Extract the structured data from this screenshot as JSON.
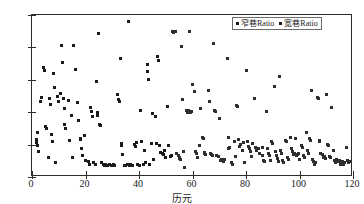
{
  "chart_data": {
    "type": "scatter",
    "title": "",
    "xlabel": "历元",
    "ylabel": "Ratio",
    "xlim": [
      0,
      120
    ],
    "ylim": [
      0,
      150
    ],
    "grid": false,
    "legend_position": "top-right",
    "xticks": [
      0,
      20,
      40,
      60,
      80,
      100,
      120
    ],
    "yticks": [
      0,
      30,
      60,
      90,
      120,
      150
    ],
    "xtick_labels": [
      "0",
      "20",
      "40",
      "60",
      "80",
      "100",
      "120"
    ],
    "ytick_labels": [
      "0",
      "30",
      "60",
      "90",
      "120",
      "150"
    ],
    "series": [
      {
        "name": "窄巷Ratio",
        "marker": "square",
        "color": "#1a1a1a",
        "points": [
          [
            1.5,
            32
          ],
          [
            1.8,
            35
          ],
          [
            2.0,
            29
          ],
          [
            2.2,
            41
          ],
          [
            2.6,
            24
          ],
          [
            3.3,
            70
          ],
          [
            3.6,
            74
          ],
          [
            4.3,
            101
          ],
          [
            4.6,
            99
          ],
          [
            5.0,
            47
          ],
          [
            5.3,
            45
          ],
          [
            6.0,
            18
          ],
          [
            6.6,
            73
          ],
          [
            7.0,
            67
          ],
          [
            7.3,
            39
          ],
          [
            7.6,
            33
          ],
          [
            8.0,
            96
          ],
          [
            8.3,
            83
          ],
          [
            8.6,
            13
          ],
          [
            9.6,
            75
          ],
          [
            10.0,
            70
          ],
          [
            10.6,
            77
          ],
          [
            11.0,
            122
          ],
          [
            11.3,
            106
          ],
          [
            11.6,
            73
          ],
          [
            12.0,
            63
          ],
          [
            12.3,
            49
          ],
          [
            12.6,
            45
          ],
          [
            13.6,
            71
          ],
          [
            14.0,
            34
          ],
          [
            14.6,
            57
          ],
          [
            15.0,
            18
          ],
          [
            15.6,
            122
          ],
          [
            16.3,
            100
          ],
          [
            17.0,
            69
          ],
          [
            17.3,
            52
          ],
          [
            18.0,
            36
          ],
          [
            18.3,
            35
          ],
          [
            18.6,
            26
          ],
          [
            19.0,
            20
          ],
          [
            19.6,
            38
          ],
          [
            20.0,
            15
          ],
          [
            21.0,
            14
          ],
          [
            21.6,
            12
          ],
          [
            22.0,
            64
          ],
          [
            22.3,
            61
          ],
          [
            22.6,
            56
          ],
          [
            23.0,
            13
          ],
          [
            23.6,
            12
          ],
          [
            24.0,
            88
          ],
          [
            24.3,
            60
          ],
          [
            24.6,
            57
          ],
          [
            25.0,
            133
          ],
          [
            25.3,
            49
          ],
          [
            25.6,
            48
          ],
          [
            26.0,
            13
          ],
          [
            26.6,
            12
          ],
          [
            27.0,
            11
          ],
          [
            27.6,
            12
          ],
          [
            28.3,
            11
          ],
          [
            29.0,
            12
          ],
          [
            29.6,
            11
          ],
          [
            30.6,
            12
          ],
          [
            31.0,
            11
          ],
          [
            32.0,
            76
          ],
          [
            32.3,
            72
          ],
          [
            32.6,
            70
          ],
          [
            33.0,
            110
          ],
          [
            33.3,
            31
          ],
          [
            33.6,
            29
          ],
          [
            34.0,
            21
          ],
          [
            34.6,
            11
          ],
          [
            35.0,
            11
          ],
          [
            35.6,
            12
          ],
          [
            36.0,
            144
          ],
          [
            36.6,
            11
          ],
          [
            37.0,
            12
          ],
          [
            37.6,
            11
          ],
          [
            38.3,
            30
          ],
          [
            38.6,
            28
          ],
          [
            39.0,
            32
          ],
          [
            39.6,
            12
          ],
          [
            40.0,
            11
          ],
          [
            40.6,
            62
          ],
          [
            41.0,
            33
          ],
          [
            41.6,
            12
          ],
          [
            42.0,
            25
          ],
          [
            42.6,
            13
          ],
          [
            43.0,
            104
          ],
          [
            43.3,
            98
          ],
          [
            43.6,
            90
          ],
          [
            44.0,
            12
          ],
          [
            44.6,
            31
          ],
          [
            45.0,
            59
          ],
          [
            45.6,
            16
          ],
          [
            46.0,
            56
          ],
          [
            46.6,
            31
          ],
          [
            47.0,
            112
          ],
          [
            47.3,
            108
          ],
          [
            47.6,
            29
          ],
          [
            48.0,
            23
          ],
          [
            48.6,
            22
          ],
          [
            49.0,
            21
          ],
          [
            49.6,
            25
          ],
          [
            50.0,
            18
          ],
          [
            50.6,
            65
          ],
          [
            51.0,
            29
          ],
          [
            51.6,
            19
          ],
          [
            52.0,
            20
          ]
        ]
      },
      {
        "name": "宽巷Ratio",
        "marker": "square",
        "color": "#2e2e2e",
        "points": [
          [
            52.6,
            135
          ],
          [
            53.0,
            134
          ],
          [
            53.6,
            135
          ],
          [
            54.0,
            22
          ],
          [
            54.6,
            20
          ],
          [
            55.0,
            17
          ],
          [
            55.3,
            18
          ],
          [
            55.6,
            16
          ],
          [
            56.0,
            121
          ],
          [
            56.3,
            72
          ],
          [
            56.6,
            24
          ],
          [
            57.0,
            9
          ],
          [
            57.6,
            62
          ],
          [
            58.0,
            61
          ],
          [
            58.3,
            60
          ],
          [
            58.6,
            62
          ],
          [
            59.0,
            135
          ],
          [
            59.3,
            60
          ],
          [
            59.6,
            61
          ],
          [
            60.0,
            86
          ],
          [
            60.6,
            79
          ],
          [
            61.0,
            24
          ],
          [
            61.6,
            22
          ],
          [
            62.0,
            18
          ],
          [
            62.6,
            29
          ],
          [
            63.0,
            63
          ],
          [
            63.6,
            37
          ],
          [
            64.0,
            36
          ],
          [
            64.3,
            23
          ],
          [
            64.6,
            22
          ],
          [
            65.0,
            21
          ],
          [
            66.0,
            80
          ],
          [
            66.3,
            70
          ],
          [
            66.6,
            22
          ],
          [
            67.0,
            21
          ],
          [
            67.6,
            20
          ],
          [
            68.0,
            124
          ],
          [
            68.3,
            62
          ],
          [
            68.6,
            61
          ],
          [
            69.0,
            20
          ],
          [
            69.6,
            19
          ],
          [
            70.0,
            54
          ],
          [
            70.6,
            15
          ],
          [
            71.0,
            16
          ],
          [
            71.6,
            14
          ],
          [
            72.0,
            16
          ],
          [
            73.0,
            110
          ],
          [
            73.3,
            37
          ],
          [
            73.6,
            26
          ],
          [
            74.0,
            27
          ],
          [
            74.6,
            13
          ],
          [
            75.0,
            12
          ],
          [
            75.6,
            33
          ],
          [
            76.0,
            19
          ],
          [
            76.6,
            66
          ],
          [
            77.0,
            65
          ],
          [
            77.3,
            35
          ],
          [
            77.6,
            28
          ],
          [
            78.0,
            30
          ],
          [
            78.6,
            25
          ],
          [
            79.0,
            32
          ],
          [
            79.6,
            13
          ],
          [
            80.0,
            99
          ],
          [
            80.6,
            33
          ],
          [
            81.0,
            28
          ],
          [
            81.3,
            26
          ],
          [
            81.6,
            24
          ],
          [
            82.0,
            19
          ],
          [
            82.6,
            31
          ],
          [
            83.0,
            73
          ],
          [
            83.6,
            27
          ],
          [
            84.0,
            25
          ],
          [
            84.6,
            26
          ],
          [
            85.0,
            22
          ],
          [
            86.0,
            27
          ],
          [
            86.3,
            20
          ],
          [
            86.6,
            15
          ],
          [
            87.0,
            14
          ],
          [
            87.6,
            61
          ],
          [
            88.0,
            26
          ],
          [
            88.3,
            22
          ],
          [
            88.6,
            20
          ],
          [
            89.0,
            15
          ],
          [
            89.6,
            33
          ],
          [
            90.0,
            31
          ],
          [
            90.6,
            84
          ],
          [
            91.0,
            24
          ],
          [
            91.3,
            20
          ],
          [
            91.6,
            17
          ],
          [
            92.0,
            14
          ],
          [
            92.6,
            93
          ],
          [
            93.0,
            25
          ],
          [
            93.3,
            22
          ],
          [
            93.6,
            15
          ],
          [
            94.0,
            13
          ],
          [
            94.6,
            34
          ],
          [
            95.0,
            33
          ],
          [
            95.6,
            18
          ],
          [
            96.0,
            16
          ],
          [
            96.6,
            37
          ],
          [
            97.0,
            26
          ],
          [
            97.3,
            24
          ],
          [
            97.6,
            21
          ],
          [
            98.0,
            22
          ],
          [
            98.6,
            36
          ],
          [
            99.0,
            20
          ],
          [
            99.3,
            21
          ],
          [
            99.6,
            22
          ],
          [
            100.0,
            16
          ],
          [
            100.6,
            29
          ],
          [
            101.0,
            27
          ],
          [
            101.6,
            20
          ],
          [
            102.0,
            18
          ],
          [
            102.6,
            41
          ],
          [
            103.0,
            25
          ],
          [
            103.3,
            22
          ],
          [
            103.6,
            36
          ],
          [
            104.0,
            34
          ],
          [
            104.6,
            80
          ],
          [
            105.0,
            16
          ],
          [
            105.3,
            14
          ],
          [
            105.6,
            12
          ],
          [
            106.0,
            13
          ],
          [
            106.6,
            74
          ],
          [
            107.0,
            73
          ],
          [
            107.3,
            34
          ],
          [
            107.6,
            33
          ],
          [
            108.0,
            22
          ],
          [
            108.6,
            21
          ],
          [
            109.0,
            18
          ],
          [
            109.3,
            19
          ],
          [
            109.6,
            17
          ],
          [
            110.0,
            76
          ],
          [
            110.6,
            30
          ],
          [
            111.0,
            29
          ],
          [
            111.3,
            19
          ],
          [
            111.6,
            18
          ],
          [
            112.0,
            64
          ],
          [
            112.6,
            25
          ],
          [
            113.0,
            15
          ],
          [
            113.3,
            14
          ],
          [
            113.6,
            13
          ],
          [
            114.0,
            16
          ],
          [
            114.6,
            14
          ],
          [
            115.0,
            15
          ],
          [
            115.3,
            12
          ],
          [
            115.6,
            13
          ],
          [
            116.0,
            14
          ],
          [
            116.6,
            12
          ],
          [
            117.0,
            13
          ],
          [
            117.6,
            27
          ],
          [
            118.0,
            15
          ],
          [
            118.3,
            13
          ],
          [
            118.6,
            14
          ]
        ]
      }
    ]
  },
  "legend": {
    "entries": [
      {
        "label": "窄巷Ratio"
      },
      {
        "label": "宽巷Ratio"
      }
    ]
  }
}
